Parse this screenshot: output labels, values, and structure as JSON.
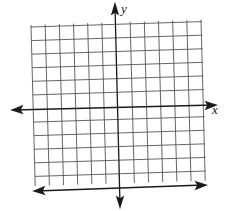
{
  "diagram": {
    "type": "coordinate-grid",
    "axes": {
      "x_label": "x",
      "y_label": "y"
    },
    "grid": {
      "columns": 12,
      "rows": 12,
      "y_axis_column_index": 6,
      "x_axis_row_index": 6
    },
    "colors": {
      "grid_line": "#555555",
      "axis_line": "#1a1a1a",
      "background": "#ffffff"
    }
  }
}
